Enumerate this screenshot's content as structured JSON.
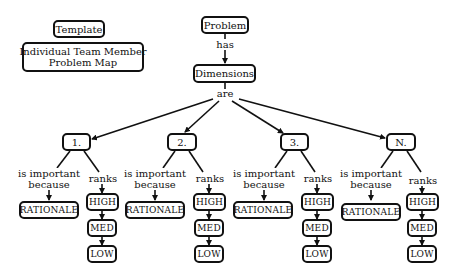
{
  "legend": {
    "template": "Template",
    "title_line1": "Individual Team Member",
    "title_line2": "Problem Map"
  },
  "root": {
    "problem": "Problem",
    "has": "has",
    "dimensions": "Dimensions",
    "are": "are"
  },
  "dimensions": [
    {
      "label": "1.",
      "because_1": "is important",
      "because_2": "because",
      "ranks": "ranks",
      "rationale": "RATIONALE",
      "high": "HIGH",
      "med": "MED",
      "low": "LOW"
    },
    {
      "label": "2.",
      "because_1": "is important",
      "because_2": "because",
      "ranks": "ranks",
      "rationale": "RATIONALE",
      "high": "HIGH",
      "med": "MED",
      "low": "LOW"
    },
    {
      "label": "3.",
      "because_1": "is important",
      "because_2": "because",
      "ranks": "ranks",
      "rationale": "RATIONALE",
      "high": "HIGH",
      "med": "MED",
      "low": "LOW"
    },
    {
      "label": "N.",
      "because_1": "is important",
      "because_2": "because",
      "ranks": "ranks",
      "rationale": "RATIONALE",
      "high": "HIGH",
      "med": "MED",
      "low": "LOW"
    }
  ],
  "colors": {
    "stroke": "#111111",
    "background": "#ffffff"
  }
}
